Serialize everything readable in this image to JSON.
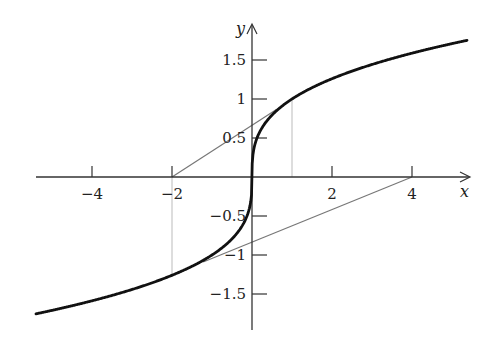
{
  "chart_data": {
    "type": "line",
    "title": "",
    "xlabel": "x",
    "ylabel": "y",
    "xlim": [
      -5.4,
      5.45
    ],
    "ylim": [
      -1.95,
      1.95
    ],
    "grid": false,
    "legend": null,
    "x_ticks": [
      -4,
      -2,
      2,
      4
    ],
    "x_tick_labels": [
      "−4",
      "−2",
      "2",
      "4"
    ],
    "y_ticks": [
      1.5,
      1,
      0.5,
      -0.5,
      -1,
      -1.5
    ],
    "y_tick_labels": [
      "1.5",
      "1",
      "0.5",
      "−0.5",
      "−1",
      "−1.5"
    ],
    "series": [
      {
        "name": "y = cbrt(x)",
        "style": "thick",
        "color": "#111111",
        "function": "cbrt",
        "x_range": [
          -5.4,
          5.375
        ]
      },
      {
        "name": "tangent at x=1",
        "style": "thin",
        "color": "#777777",
        "points": [
          [
            -2,
            0
          ],
          [
            0.62,
            0.87
          ]
        ]
      },
      {
        "name": "tangent at x=-2",
        "style": "thin",
        "color": "#777777",
        "points": [
          [
            4,
            0
          ],
          [
            -1.22,
            -1.09
          ]
        ]
      }
    ],
    "annotations": [
      {
        "type": "vline",
        "x": 1,
        "from_y": 0,
        "to_y": 1,
        "color": "#bbbbbb"
      },
      {
        "type": "vline",
        "x": -2,
        "from_y": 0,
        "to_y": -1.26,
        "color": "#bbbbbb"
      }
    ]
  },
  "axes": {
    "x_label": "x",
    "y_label": "y"
  }
}
